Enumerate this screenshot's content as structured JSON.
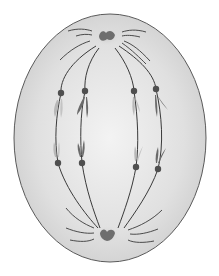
{
  "diagram": {
    "title": "",
    "colors": {
      "background": "#ffffff",
      "cell_fill_center": "#f1f1f1",
      "cell_fill_edge": "#d2d2d2",
      "cell_outline": "#5a5a5a",
      "spindle_fiber": "#3a3a3a",
      "centrosome_dark": "#6e6e6e",
      "centrosome_halo": "#bdbdbd",
      "kinetochore": "#4f4f4f",
      "chromatid_dark": "#6a6a6a",
      "chromatid_light": "#b8b8b8"
    },
    "cell": {
      "cx": 110,
      "cy": 138,
      "rx": 96,
      "ry": 124
    },
    "poles": [
      {
        "name": "top-pole",
        "x": 107,
        "y": 37
      },
      {
        "name": "bottom-pole",
        "x": 107,
        "y": 235
      }
    ],
    "kinetochores_top": [
      {
        "x": 61,
        "y": 93,
        "shade": "light"
      },
      {
        "x": 85,
        "y": 91,
        "shade": "dark"
      },
      {
        "x": 134,
        "y": 91,
        "shade": "light"
      },
      {
        "x": 156,
        "y": 89,
        "shade": "dark"
      }
    ],
    "kinetochores_bottom": [
      {
        "x": 58,
        "y": 163,
        "shade": "light"
      },
      {
        "x": 82,
        "y": 163,
        "shade": "dark"
      },
      {
        "x": 136,
        "y": 167,
        "shade": "light"
      },
      {
        "x": 158,
        "y": 169,
        "shade": "dark"
      }
    ],
    "labels": []
  }
}
